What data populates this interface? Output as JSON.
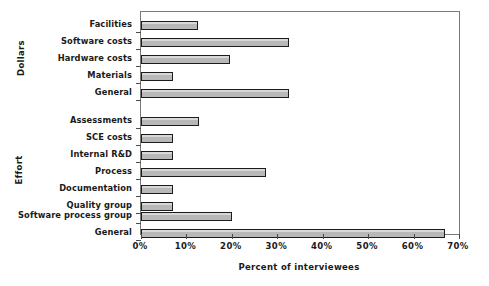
{
  "chart_data": {
    "type": "bar",
    "orientation": "horizontal",
    "title": "",
    "xlabel": "Percent of interviewees",
    "ylabel": "",
    "xlim": [
      0,
      70
    ],
    "grid": false,
    "legend": null,
    "xtick_labels": [
      "0%",
      "10%",
      "20%",
      "30%",
      "40%",
      "50%",
      "60%",
      "70%"
    ],
    "xtick_values": [
      0,
      10,
      20,
      30,
      40,
      50,
      60,
      70
    ],
    "groups": [
      {
        "name": "Dollars",
        "categories": [
          "Facilities",
          "Software costs",
          "Hardware costs",
          "Materials",
          "General"
        ],
        "values": [
          12.5,
          32.5,
          19.5,
          7,
          32.5
        ]
      },
      {
        "name": "Effort",
        "categories": [
          "Assessments",
          "SCE costs",
          "Internal R&D",
          "Process",
          "Documentation",
          "Quality group",
          "Software process group",
          "General"
        ],
        "values": [
          12.8,
          7,
          7,
          27.5,
          7,
          7,
          20,
          67
        ]
      }
    ],
    "categories": [
      "Facilities",
      "Software costs",
      "Hardware costs",
      "Materials",
      "General",
      "Assessments",
      "SCE costs",
      "Internal R&D",
      "Process",
      "Documentation",
      "Quality group",
      "Software process group",
      "General"
    ],
    "values": [
      12.5,
      32.5,
      19.5,
      7,
      32.5,
      12.8,
      7,
      7,
      27.5,
      7,
      7,
      20,
      67
    ],
    "colors": {
      "bar_fill": "#b8b8b8",
      "bar_edge": "#1c1c1c",
      "axis": "#7a7a7a",
      "text": "#1a1a1a",
      "background": "#ffffff"
    }
  },
  "axes": {
    "group_labels": [
      "Dollars",
      "Effort"
    ],
    "xaxis_title": "Percent of interviewees"
  }
}
